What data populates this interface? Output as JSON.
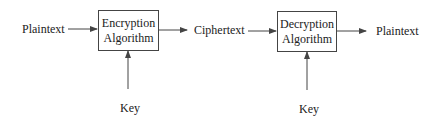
{
  "diagram": {
    "inputs": {
      "plaintext_in": "Plaintext",
      "ciphertext": "Ciphertext",
      "plaintext_out": "Plaintext"
    },
    "encryption": {
      "line1": "Encryption",
      "line2": "Algorithm",
      "key": "Key"
    },
    "decryption": {
      "line1": "Decryption",
      "line2": "Algorithm",
      "key": "Key"
    }
  }
}
